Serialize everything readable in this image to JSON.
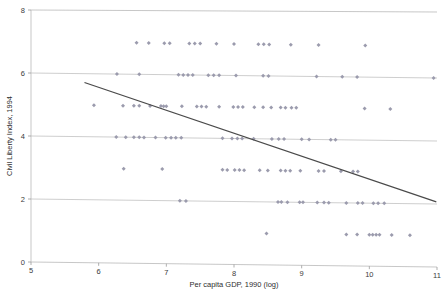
{
  "chart_data": {
    "type": "scatter",
    "title": "",
    "xlabel": "Per capita GDP, 1990 (log)",
    "ylabel": "Civil Liberty Index, 1994",
    "xlim": [
      5,
      11
    ],
    "ylim": [
      0,
      8
    ],
    "xticks": [
      "5",
      "6",
      "7",
      "8",
      "9",
      "10",
      "11"
    ],
    "yticks": [
      "0",
      "2",
      "4",
      "6",
      "8"
    ],
    "grid": true,
    "legend": null,
    "marker_color": "#9b9bad",
    "marker_shape": "diamond",
    "trendline": {
      "label": "linear fit",
      "color": "#4a4a4a",
      "x_start": 5.79,
      "y_start": 5.72,
      "x_end": 10.99,
      "y_end": 2.07
    },
    "points": [
      {
        "x": 6.56,
        "y": 7
      },
      {
        "x": 6.74,
        "y": 7
      },
      {
        "x": 6.97,
        "y": 7
      },
      {
        "x": 7.05,
        "y": 7
      },
      {
        "x": 7.34,
        "y": 7
      },
      {
        "x": 7.42,
        "y": 7
      },
      {
        "x": 7.5,
        "y": 7
      },
      {
        "x": 7.74,
        "y": 7
      },
      {
        "x": 8.0,
        "y": 7
      },
      {
        "x": 8.36,
        "y": 7
      },
      {
        "x": 8.44,
        "y": 7
      },
      {
        "x": 8.52,
        "y": 7
      },
      {
        "x": 8.84,
        "y": 7
      },
      {
        "x": 9.25,
        "y": 7
      },
      {
        "x": 9.94,
        "y": 7
      },
      {
        "x": 6.27,
        "y": 6
      },
      {
        "x": 6.6,
        "y": 6
      },
      {
        "x": 7.18,
        "y": 6
      },
      {
        "x": 7.25,
        "y": 6
      },
      {
        "x": 7.32,
        "y": 6
      },
      {
        "x": 7.39,
        "y": 6
      },
      {
        "x": 7.62,
        "y": 6
      },
      {
        "x": 7.7,
        "y": 6
      },
      {
        "x": 7.78,
        "y": 6
      },
      {
        "x": 8.03,
        "y": 6
      },
      {
        "x": 8.43,
        "y": 6
      },
      {
        "x": 8.51,
        "y": 6
      },
      {
        "x": 9.22,
        "y": 6
      },
      {
        "x": 9.6,
        "y": 6
      },
      {
        "x": 9.82,
        "y": 6
      },
      {
        "x": 10.95,
        "y": 6
      },
      {
        "x": 5.93,
        "y": 5
      },
      {
        "x": 6.36,
        "y": 5
      },
      {
        "x": 6.52,
        "y": 5
      },
      {
        "x": 6.6,
        "y": 5
      },
      {
        "x": 6.76,
        "y": 5
      },
      {
        "x": 6.92,
        "y": 5
      },
      {
        "x": 6.96,
        "y": 5
      },
      {
        "x": 7.0,
        "y": 5
      },
      {
        "x": 7.23,
        "y": 5
      },
      {
        "x": 7.45,
        "y": 5
      },
      {
        "x": 7.52,
        "y": 5
      },
      {
        "x": 7.59,
        "y": 5
      },
      {
        "x": 7.78,
        "y": 5
      },
      {
        "x": 7.99,
        "y": 5
      },
      {
        "x": 8.06,
        "y": 5
      },
      {
        "x": 8.13,
        "y": 5
      },
      {
        "x": 8.3,
        "y": 5
      },
      {
        "x": 8.43,
        "y": 5
      },
      {
        "x": 8.55,
        "y": 5
      },
      {
        "x": 8.69,
        "y": 5
      },
      {
        "x": 8.76,
        "y": 5
      },
      {
        "x": 8.85,
        "y": 5
      },
      {
        "x": 8.92,
        "y": 5
      },
      {
        "x": 9.93,
        "y": 5
      },
      {
        "x": 10.31,
        "y": 5
      },
      {
        "x": 6.26,
        "y": 4
      },
      {
        "x": 6.4,
        "y": 4
      },
      {
        "x": 6.52,
        "y": 4
      },
      {
        "x": 6.6,
        "y": 4
      },
      {
        "x": 6.67,
        "y": 4
      },
      {
        "x": 6.84,
        "y": 4
      },
      {
        "x": 6.99,
        "y": 4
      },
      {
        "x": 7.07,
        "y": 4
      },
      {
        "x": 7.14,
        "y": 4
      },
      {
        "x": 7.22,
        "y": 4
      },
      {
        "x": 7.83,
        "y": 4
      },
      {
        "x": 7.97,
        "y": 4
      },
      {
        "x": 8.05,
        "y": 4
      },
      {
        "x": 8.12,
        "y": 4
      },
      {
        "x": 8.29,
        "y": 4
      },
      {
        "x": 8.56,
        "y": 4
      },
      {
        "x": 8.66,
        "y": 4
      },
      {
        "x": 8.74,
        "y": 4
      },
      {
        "x": 9.0,
        "y": 4
      },
      {
        "x": 9.11,
        "y": 4
      },
      {
        "x": 9.43,
        "y": 4
      },
      {
        "x": 9.5,
        "y": 4
      },
      {
        "x": 6.37,
        "y": 3
      },
      {
        "x": 6.94,
        "y": 3
      },
      {
        "x": 7.83,
        "y": 3
      },
      {
        "x": 7.9,
        "y": 3
      },
      {
        "x": 8.01,
        "y": 3
      },
      {
        "x": 8.08,
        "y": 3
      },
      {
        "x": 8.15,
        "y": 3
      },
      {
        "x": 8.38,
        "y": 3
      },
      {
        "x": 8.5,
        "y": 3
      },
      {
        "x": 8.69,
        "y": 3
      },
      {
        "x": 8.76,
        "y": 3
      },
      {
        "x": 8.83,
        "y": 3
      },
      {
        "x": 8.98,
        "y": 3
      },
      {
        "x": 9.25,
        "y": 3
      },
      {
        "x": 9.33,
        "y": 3
      },
      {
        "x": 9.58,
        "y": 3
      },
      {
        "x": 9.76,
        "y": 3
      },
      {
        "x": 9.83,
        "y": 3
      },
      {
        "x": 7.2,
        "y": 2
      },
      {
        "x": 7.29,
        "y": 2
      },
      {
        "x": 8.65,
        "y": 2
      },
      {
        "x": 8.7,
        "y": 2
      },
      {
        "x": 8.79,
        "y": 2
      },
      {
        "x": 8.97,
        "y": 2
      },
      {
        "x": 9.02,
        "y": 2
      },
      {
        "x": 9.23,
        "y": 2
      },
      {
        "x": 9.33,
        "y": 2
      },
      {
        "x": 9.4,
        "y": 2
      },
      {
        "x": 9.66,
        "y": 2
      },
      {
        "x": 9.83,
        "y": 2
      },
      {
        "x": 9.9,
        "y": 2
      },
      {
        "x": 10.06,
        "y": 2
      },
      {
        "x": 10.13,
        "y": 2
      },
      {
        "x": 10.22,
        "y": 2
      },
      {
        "x": 8.48,
        "y": 1
      },
      {
        "x": 9.66,
        "y": 1
      },
      {
        "x": 9.82,
        "y": 1
      },
      {
        "x": 10.0,
        "y": 1
      },
      {
        "x": 10.05,
        "y": 1
      },
      {
        "x": 10.1,
        "y": 1
      },
      {
        "x": 10.15,
        "y": 1
      },
      {
        "x": 10.33,
        "y": 1
      },
      {
        "x": 10.6,
        "y": 1
      }
    ]
  }
}
